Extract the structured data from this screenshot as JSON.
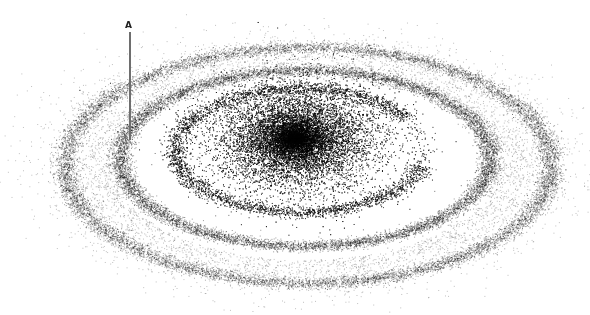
{
  "figure": {
    "background": "#ffffff",
    "dot_color": "#000000",
    "center": [
      300,
      145
    ],
    "seed": 12345,
    "components": [
      {
        "type": "core",
        "cx": 295,
        "cy": 138,
        "rx": 95,
        "ry": 62,
        "count": 26000,
        "alpha": 0.55
      },
      {
        "type": "ring",
        "cx": 300,
        "cy": 150,
        "rx": 125,
        "ry": 62,
        "width": 12,
        "count": 9000,
        "alpha": 0.45,
        "gap_start": -0.55,
        "gap_end": 0.25
      },
      {
        "type": "ring",
        "cx": 305,
        "cy": 158,
        "rx": 185,
        "ry": 88,
        "width": 11,
        "count": 10000,
        "alpha": 0.4
      },
      {
        "type": "ring",
        "cx": 308,
        "cy": 165,
        "rx": 243,
        "ry": 118,
        "width": 12,
        "count": 11000,
        "alpha": 0.35
      },
      {
        "type": "halo",
        "cx": 305,
        "cy": 165,
        "rx": 275,
        "ry": 135,
        "count": 5000,
        "alpha": 0.25
      }
    ]
  },
  "annotation": {
    "label": "A",
    "line_color": "#6e6e6e"
  }
}
